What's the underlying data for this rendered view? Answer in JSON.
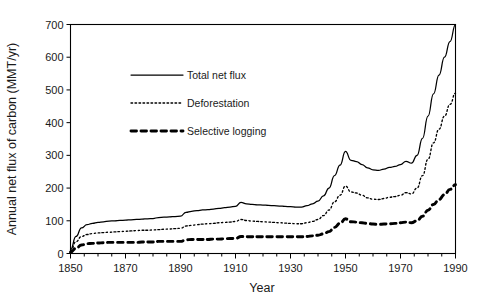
{
  "chart_data": {
    "type": "line",
    "title": "",
    "xlabel": "Year",
    "ylabel": "Annual net flux of carbon (MMT/yr)",
    "xlim": [
      1850,
      1990
    ],
    "ylim": [
      0,
      700
    ],
    "xticks": [
      1850,
      1870,
      1890,
      1910,
      1930,
      1950,
      1970,
      1990
    ],
    "xtick_labels": [
      "1850",
      "1870",
      "1890",
      "1910",
      "1930",
      "1950",
      "1970",
      "1990"
    ],
    "xminor_step": 5,
    "yticks": [
      0,
      100,
      200,
      300,
      400,
      500,
      600,
      700
    ],
    "ytick_labels": [
      "0",
      "100",
      "200",
      "300",
      "400",
      "500",
      "600",
      "700"
    ],
    "grid": false,
    "legend_position": "upper-left-inside",
    "x": [
      1850,
      1852,
      1854,
      1856,
      1858,
      1860,
      1862,
      1864,
      1866,
      1868,
      1870,
      1872,
      1874,
      1876,
      1878,
      1880,
      1882,
      1884,
      1886,
      1888,
      1890,
      1892,
      1894,
      1896,
      1898,
      1900,
      1902,
      1904,
      1906,
      1908,
      1910,
      1912,
      1914,
      1916,
      1918,
      1920,
      1922,
      1924,
      1926,
      1928,
      1930,
      1932,
      1934,
      1936,
      1938,
      1940,
      1942,
      1944,
      1946,
      1948,
      1950,
      1952,
      1954,
      1956,
      1958,
      1960,
      1962,
      1964,
      1966,
      1968,
      1970,
      1972,
      1974,
      1976,
      1978,
      1980,
      1982,
      1984,
      1986,
      1988,
      1990
    ],
    "series": [
      {
        "name": "Total net flux",
        "style": "solid",
        "values": [
          12,
          52,
          78,
          88,
          92,
          95,
          97,
          99,
          100,
          101,
          102,
          103,
          104,
          105,
          106,
          107,
          110,
          111,
          112,
          113,
          114,
          126,
          129,
          131,
          133,
          134,
          136,
          138,
          140,
          142,
          144,
          156,
          152,
          150,
          149,
          148,
          147,
          146,
          145,
          144,
          143,
          142,
          142,
          146,
          152,
          160,
          176,
          200,
          238,
          270,
          312,
          285,
          281,
          272,
          262,
          256,
          254,
          258,
          263,
          266,
          272,
          282,
          276,
          300,
          352,
          420,
          488,
          545,
          600,
          648,
          700
        ]
      },
      {
        "name": "Deforestation",
        "style": "dotted",
        "values": [
          8,
          36,
          52,
          58,
          61,
          63,
          64,
          65,
          66,
          67,
          68,
          69,
          70,
          71,
          71,
          72,
          73,
          74,
          75,
          76,
          77,
          84,
          86,
          88,
          90,
          91,
          92,
          94,
          95,
          96,
          98,
          104,
          101,
          99,
          98,
          97,
          96,
          95,
          94,
          93,
          92,
          91,
          91,
          94,
          98,
          104,
          116,
          133,
          158,
          178,
          206,
          188,
          185,
          178,
          170,
          166,
          165,
          168,
          172,
          174,
          178,
          186,
          182,
          200,
          238,
          288,
          338,
          380,
          420,
          456,
          490
        ]
      },
      {
        "name": "Selective logging",
        "style": "dashed",
        "values": [
          4,
          16,
          26,
          30,
          31,
          32,
          33,
          34,
          34,
          34,
          34,
          34,
          34,
          35,
          35,
          35,
          37,
          37,
          37,
          37,
          37,
          42,
          43,
          43,
          43,
          43,
          44,
          44,
          45,
          46,
          46,
          52,
          51,
          51,
          51,
          51,
          51,
          51,
          51,
          51,
          51,
          51,
          51,
          52,
          54,
          56,
          60,
          67,
          80,
          92,
          106,
          97,
          96,
          94,
          92,
          90,
          89,
          90,
          91,
          92,
          94,
          96,
          94,
          100,
          114,
          132,
          150,
          165,
          180,
          196,
          210
        ]
      }
    ]
  },
  "legend": {
    "items": [
      {
        "label": "Total net flux",
        "style": "solid"
      },
      {
        "label": "Deforestation",
        "style": "dotted"
      },
      {
        "label": "Selective logging",
        "style": "dashed"
      }
    ]
  }
}
